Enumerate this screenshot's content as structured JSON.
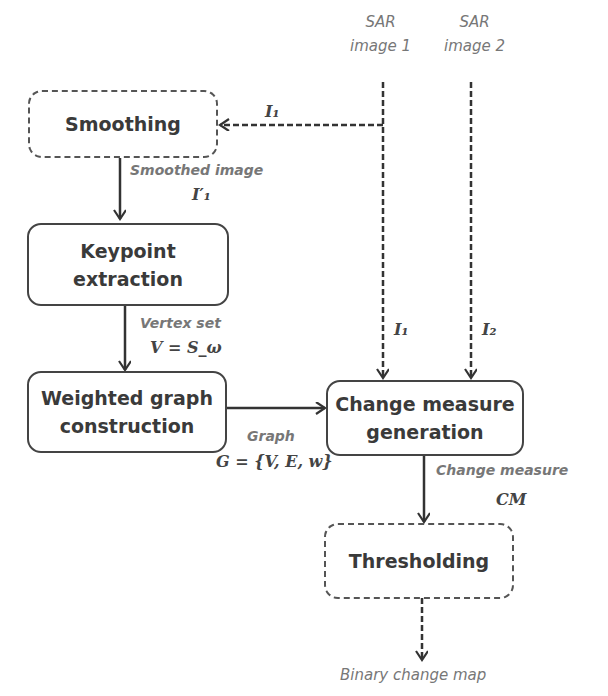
{
  "inputs": {
    "sar1": [
      "SAR",
      "image 1"
    ],
    "sar2": [
      "SAR",
      "image 2"
    ]
  },
  "boxes": {
    "smoothing": "Smoothing",
    "keypoint": [
      "Keypoint",
      "extraction"
    ],
    "graph": [
      "Weighted graph",
      "construction"
    ],
    "change": [
      "Change measure",
      "generation"
    ],
    "threshold": "Thresholding"
  },
  "labels": {
    "i1_top": "I₁",
    "smoothed_image": "Smoothed image",
    "i1_prime": "I′₁",
    "vertex_set": "Vertex set",
    "v_eq": "V = S_ω",
    "i1_mid": "I₁",
    "i2_mid": "I₂",
    "graph": "Graph",
    "g_eq": "G = {V, E, w}",
    "change_measure": "Change measure",
    "cm": "CM",
    "output": "Binary change map"
  }
}
